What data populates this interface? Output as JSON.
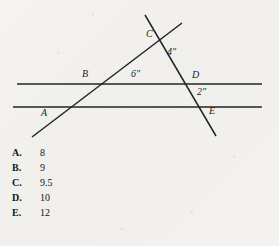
{
  "figure": {
    "name": "two-parallel-lines-with-two-transversals",
    "points": [
      {
        "label": "C",
        "x": 146,
        "y": 29
      },
      {
        "label": "B",
        "x": 82,
        "y": 69
      },
      {
        "label": "D",
        "x": 192,
        "y": 70
      },
      {
        "label": "A",
        "x": 41,
        "y": 108
      },
      {
        "label": "E",
        "x": 209,
        "y": 106
      }
    ],
    "measures": [
      {
        "label": "4\"",
        "x": 167,
        "y": 47
      },
      {
        "label": "6\"",
        "x": 131,
        "y": 69
      },
      {
        "label": "2\"",
        "x": 197,
        "y": 87
      }
    ],
    "lines": [
      {
        "name": "upper-parallel-line",
        "x1": 17,
        "y1": 84,
        "x2": 262,
        "y2": 84
      },
      {
        "name": "lower-parallel-line",
        "x1": 13,
        "y1": 107,
        "x2": 262,
        "y2": 107
      },
      {
        "name": "ascending-transversal-AC",
        "x1": 32,
        "y1": 137,
        "x2": 182,
        "y2": 23
      },
      {
        "name": "descending-transversal-CE",
        "x1": 145,
        "y1": 15,
        "x2": 216,
        "y2": 136
      }
    ],
    "stroke_color": "#242424"
  },
  "choices": [
    {
      "letter": "A.",
      "value": "8"
    },
    {
      "letter": "B.",
      "value": "9"
    },
    {
      "letter": "C.",
      "value": "9.5"
    },
    {
      "letter": "D.",
      "value": "10"
    },
    {
      "letter": "E.",
      "value": "12"
    }
  ],
  "colors": {
    "background": "#f2f1ee",
    "ink": "#1b1b1b"
  }
}
